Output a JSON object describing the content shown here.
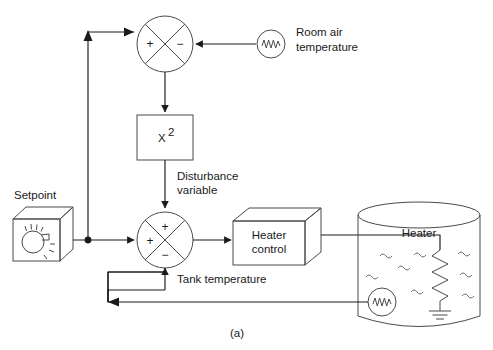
{
  "figure": {
    "caption": "(a)",
    "type": "control-system-block-diagram"
  },
  "blocks": {
    "setpoint": {
      "label": "Setpoint",
      "icon": "dial-knob-box-icon"
    },
    "squarer": {
      "label": "X",
      "exponent": "2"
    },
    "heater_control": {
      "label_line1": "Heater",
      "label_line2": "control"
    },
    "tank": {
      "heater_label": "Heater",
      "icon": "cylindrical-tank-icon"
    }
  },
  "sensors": {
    "room_air": {
      "label_line1": "Room air",
      "label_line2": "temperature",
      "icon": "thermistor-sensor-icon"
    },
    "tank_temp": {
      "icon": "thermistor-sensor-icon"
    }
  },
  "signals": {
    "disturbance": {
      "label_line1": "Disturbance",
      "label_line2": "variable"
    },
    "tank_temperature": {
      "label": "Tank temperature"
    }
  },
  "summing_junctions": {
    "top": {
      "name": "top-summing-junction",
      "sign_left": "+",
      "sign_right": "−"
    },
    "bottom": {
      "name": "bottom-summing-junction",
      "sign_top": "+",
      "sign_left": "+",
      "sign_bottom": "−"
    }
  },
  "colors": {
    "line": "#1a1a1a",
    "shape": "#4a4a4a",
    "background": "#ffffff"
  }
}
